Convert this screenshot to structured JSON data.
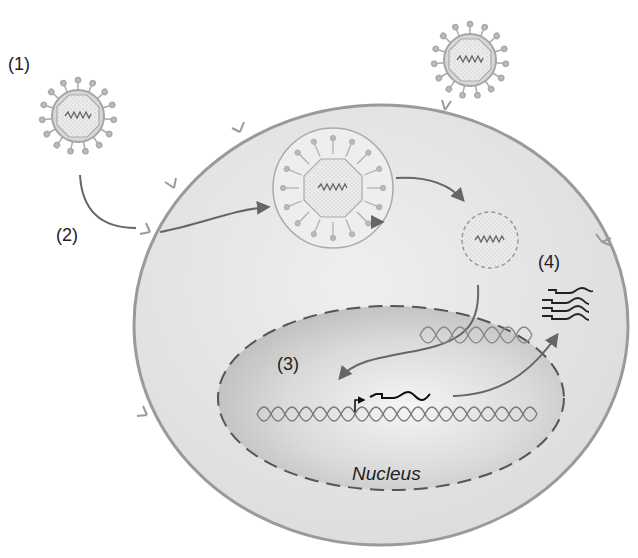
{
  "diagram": {
    "type": "process-diagram",
    "labels": {
      "step1": "(1)",
      "step2": "(2)",
      "step3": "(3)",
      "step4": "(4)",
      "nucleus": "Nucleus"
    },
    "elements": [
      {
        "id": "virus-free",
        "desc": "Enveloped virus particle with spike proteins and genome, outside cell",
        "step": "(1)"
      },
      {
        "id": "virus-attached",
        "desc": "Virus attached to receptor on cell membrane"
      },
      {
        "id": "endosome",
        "desc": "Virus engulfed in endocytic vesicle",
        "step": "(2)"
      },
      {
        "id": "uncoated-capsid",
        "desc": "Capsid releasing viral genome (dashed outline)"
      },
      {
        "id": "viral-dna",
        "desc": "Viral DNA entering nucleus / integrating into host DNA",
        "step": "(3)"
      },
      {
        "id": "transcript",
        "desc": "Transcription from promoter (bent arrow) producing mRNA"
      },
      {
        "id": "mrna-copies",
        "desc": "Multiple mRNA strands exported to cytoplasm",
        "step": "(4)"
      }
    ],
    "colors": {
      "background": "#ffffff",
      "cell_fill": "#e6e6e6",
      "cell_outline": "#9a9a9a",
      "nucleus_fill": "#cfcfcf",
      "nucleus_outline": "#555555",
      "arrow": "#666666",
      "label_text": "#222222",
      "mrna": "#222222"
    }
  }
}
